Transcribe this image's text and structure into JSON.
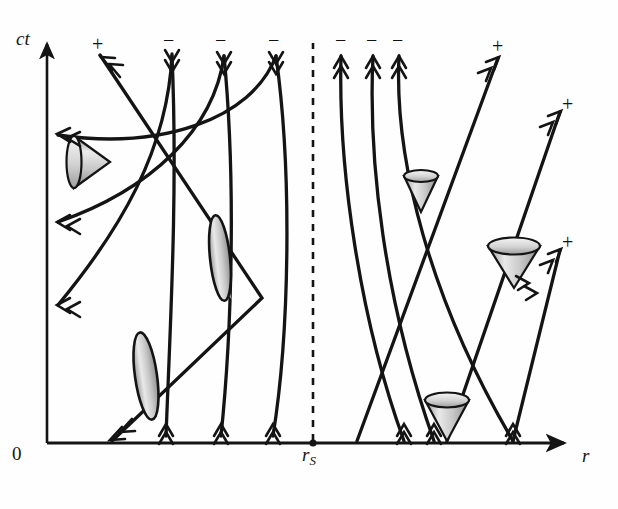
{
  "figure": {
    "kind": "spacetime-diagram"
  },
  "axes": {
    "y_label": "ct",
    "x_label": "r",
    "origin_label": "0",
    "horizon_label": "r",
    "horizon_sub": "S",
    "x_axis": {
      "x0": 47,
      "x1": 568,
      "y": 443
    },
    "y_axis": {
      "x": 47,
      "y0": 443,
      "y1": 40
    },
    "horizon_x": 313,
    "ink": "#141414",
    "cone_fill_light": "#f2f2f2",
    "cone_fill_dark": "#8c8c8c"
  },
  "chart_data": {
    "type": "line",
    "title": "",
    "xlabel": "r",
    "ylabel": "ct",
    "annotations": [
      {
        "text": "0",
        "x": 18,
        "y": 455
      },
      {
        "text": "r_S",
        "x": 305,
        "y": 455
      },
      {
        "text": "r",
        "x": 585,
        "y": 455
      },
      {
        "text": "ct",
        "x": 20,
        "y": 42
      }
    ],
    "horizon": {
      "label": "r_S",
      "x_pixel": 313,
      "style": "dashed-vertical"
    },
    "series": [
      {
        "name": "outgoing-inside-1",
        "sign": "+",
        "endpoint": "top-left"
      },
      {
        "name": "ingoing-inside-1",
        "sign": "-",
        "endpoint": "top"
      },
      {
        "name": "ingoing-inside-2",
        "sign": "-",
        "endpoint": "top"
      },
      {
        "name": "ingoing-inside-3",
        "sign": "-",
        "endpoint": "top"
      },
      {
        "name": "ingoing-outside-1",
        "sign": "-",
        "endpoint": "top"
      },
      {
        "name": "ingoing-outside-2",
        "sign": "-",
        "endpoint": "top"
      },
      {
        "name": "ingoing-outside-3",
        "sign": "-",
        "endpoint": "top"
      },
      {
        "name": "outgoing-outside-1",
        "sign": "+",
        "endpoint": "top-right"
      },
      {
        "name": "outgoing-outside-2",
        "sign": "+",
        "endpoint": "right"
      },
      {
        "name": "outgoing-outside-3",
        "sign": "+",
        "endpoint": "right"
      }
    ]
  },
  "markers": {
    "top_signs": [
      {
        "id": "plus-top-left",
        "text": "+",
        "x": 92,
        "y": 34
      },
      {
        "id": "minus-top-1",
        "text": "−",
        "x": 163,
        "y": 30
      },
      {
        "id": "minus-top-2",
        "text": "−",
        "x": 215,
        "y": 30
      },
      {
        "id": "minus-top-3",
        "text": "−",
        "x": 268,
        "y": 30
      },
      {
        "id": "minus-top-4",
        "text": "−",
        "x": 335,
        "y": 30
      },
      {
        "id": "minus-top-5",
        "text": "−",
        "x": 366,
        "y": 30
      },
      {
        "id": "minus-top-6",
        "text": "−",
        "x": 392,
        "y": 30
      },
      {
        "id": "plus-top-right",
        "text": "+",
        "x": 492,
        "y": 36
      }
    ],
    "side_signs": [
      {
        "id": "plus-right-upper",
        "text": "+",
        "x": 562,
        "y": 94
      },
      {
        "id": "plus-right-lower",
        "text": "+",
        "x": 562,
        "y": 232
      }
    ]
  },
  "light_cones": [
    {
      "id": "cone-inside-upper",
      "cx": 84,
      "cy": 162,
      "orientation": "left",
      "size": 30
    },
    {
      "id": "cone-inside-mid",
      "cx": 222,
      "cy": 258,
      "orientation": "left-narrow",
      "size": 26
    },
    {
      "id": "cone-inside-lower",
      "cx": 146,
      "cy": 376,
      "orientation": "left-narrow",
      "size": 26
    },
    {
      "id": "cone-outside-upper",
      "cx": 421,
      "cy": 186,
      "orientation": "down",
      "size": 22
    },
    {
      "id": "cone-outside-right",
      "cx": 514,
      "cy": 256,
      "orientation": "down-wide",
      "size": 32
    },
    {
      "id": "cone-outside-base",
      "cx": 447,
      "cy": 419,
      "orientation": "down",
      "size": 27
    }
  ]
}
